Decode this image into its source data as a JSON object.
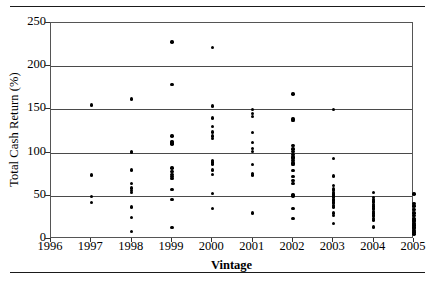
{
  "chart_data": {
    "type": "scatter",
    "title": "",
    "xlabel": "Vintage",
    "ylabel": "Total Cash Return (%)",
    "xlim": [
      1996,
      2005
    ],
    "ylim": [
      0,
      250
    ],
    "x_tick_labels": [
      "1996",
      "1997",
      "1998",
      "1999",
      "2000",
      "2001",
      "2002",
      "2003",
      "2004",
      "2005"
    ],
    "y_tick_labels": [
      "0",
      "50",
      "100",
      "150",
      "200",
      "250"
    ],
    "y_ticks": [
      0,
      50,
      100,
      150,
      200,
      250
    ],
    "grid": "horizontal",
    "legend": "none",
    "marker": "filled-circle",
    "marker_color": "#000000",
    "series": [
      {
        "name": "Total Cash Return by Vintage",
        "points": [
          {
            "x": 1997,
            "y": 155
          },
          {
            "x": 1997,
            "y": 74
          },
          {
            "x": 1997,
            "y": 49
          },
          {
            "x": 1997,
            "y": 42
          },
          {
            "x": 1998,
            "y": 162
          },
          {
            "x": 1998,
            "y": 101
          },
          {
            "x": 1998,
            "y": 100
          },
          {
            "x": 1998,
            "y": 80
          },
          {
            "x": 1998,
            "y": 64
          },
          {
            "x": 1998,
            "y": 59
          },
          {
            "x": 1998,
            "y": 56
          },
          {
            "x": 1998,
            "y": 54
          },
          {
            "x": 1998,
            "y": 37
          },
          {
            "x": 1998,
            "y": 25
          },
          {
            "x": 1998,
            "y": 9
          },
          {
            "x": 1999,
            "y": 228
          },
          {
            "x": 1999,
            "y": 179
          },
          {
            "x": 1999,
            "y": 119
          },
          {
            "x": 1999,
            "y": 113
          },
          {
            "x": 1999,
            "y": 111
          },
          {
            "x": 1999,
            "y": 110
          },
          {
            "x": 1999,
            "y": 82
          },
          {
            "x": 1999,
            "y": 78
          },
          {
            "x": 1999,
            "y": 75
          },
          {
            "x": 1999,
            "y": 72
          },
          {
            "x": 1999,
            "y": 70
          },
          {
            "x": 1999,
            "y": 57
          },
          {
            "x": 1999,
            "y": 46
          },
          {
            "x": 1999,
            "y": 13
          },
          {
            "x": 2000,
            "y": 222
          },
          {
            "x": 2000,
            "y": 154
          },
          {
            "x": 2000,
            "y": 140
          },
          {
            "x": 2000,
            "y": 130
          },
          {
            "x": 2000,
            "y": 124
          },
          {
            "x": 2000,
            "y": 119
          },
          {
            "x": 2000,
            "y": 116
          },
          {
            "x": 2000,
            "y": 91
          },
          {
            "x": 2000,
            "y": 89
          },
          {
            "x": 2000,
            "y": 87
          },
          {
            "x": 2000,
            "y": 80
          },
          {
            "x": 2000,
            "y": 75
          },
          {
            "x": 2000,
            "y": 53
          },
          {
            "x": 2000,
            "y": 35
          },
          {
            "x": 2001,
            "y": 150
          },
          {
            "x": 2001,
            "y": 145
          },
          {
            "x": 2001,
            "y": 142
          },
          {
            "x": 2001,
            "y": 123
          },
          {
            "x": 2001,
            "y": 112
          },
          {
            "x": 2001,
            "y": 105
          },
          {
            "x": 2001,
            "y": 101
          },
          {
            "x": 2001,
            "y": 86
          },
          {
            "x": 2001,
            "y": 76
          },
          {
            "x": 2001,
            "y": 74
          },
          {
            "x": 2001,
            "y": 30
          },
          {
            "x": 2002,
            "y": 168
          },
          {
            "x": 2002,
            "y": 139
          },
          {
            "x": 2002,
            "y": 137
          },
          {
            "x": 2002,
            "y": 108
          },
          {
            "x": 2002,
            "y": 104
          },
          {
            "x": 2002,
            "y": 101
          },
          {
            "x": 2002,
            "y": 98
          },
          {
            "x": 2002,
            "y": 95
          },
          {
            "x": 2002,
            "y": 93
          },
          {
            "x": 2002,
            "y": 91
          },
          {
            "x": 2002,
            "y": 88
          },
          {
            "x": 2002,
            "y": 86
          },
          {
            "x": 2002,
            "y": 79
          },
          {
            "x": 2002,
            "y": 72
          },
          {
            "x": 2002,
            "y": 68
          },
          {
            "x": 2002,
            "y": 64
          },
          {
            "x": 2002,
            "y": 51
          },
          {
            "x": 2002,
            "y": 50
          },
          {
            "x": 2002,
            "y": 35
          },
          {
            "x": 2002,
            "y": 24
          },
          {
            "x": 2003,
            "y": 150
          },
          {
            "x": 2003,
            "y": 93
          },
          {
            "x": 2003,
            "y": 73
          },
          {
            "x": 2003,
            "y": 62
          },
          {
            "x": 2003,
            "y": 58
          },
          {
            "x": 2003,
            "y": 56
          },
          {
            "x": 2003,
            "y": 54
          },
          {
            "x": 2003,
            "y": 52
          },
          {
            "x": 2003,
            "y": 51
          },
          {
            "x": 2003,
            "y": 50
          },
          {
            "x": 2003,
            "y": 49
          },
          {
            "x": 2003,
            "y": 48
          },
          {
            "x": 2003,
            "y": 46
          },
          {
            "x": 2003,
            "y": 45
          },
          {
            "x": 2003,
            "y": 43
          },
          {
            "x": 2003,
            "y": 41
          },
          {
            "x": 2003,
            "y": 39
          },
          {
            "x": 2003,
            "y": 37
          },
          {
            "x": 2003,
            "y": 30
          },
          {
            "x": 2003,
            "y": 27
          },
          {
            "x": 2003,
            "y": 18
          },
          {
            "x": 2004,
            "y": 54
          },
          {
            "x": 2004,
            "y": 48
          },
          {
            "x": 2004,
            "y": 46
          },
          {
            "x": 2004,
            "y": 44
          },
          {
            "x": 2004,
            "y": 42
          },
          {
            "x": 2004,
            "y": 40
          },
          {
            "x": 2004,
            "y": 38
          },
          {
            "x": 2004,
            "y": 36
          },
          {
            "x": 2004,
            "y": 34
          },
          {
            "x": 2004,
            "y": 32
          },
          {
            "x": 2004,
            "y": 30
          },
          {
            "x": 2004,
            "y": 28
          },
          {
            "x": 2004,
            "y": 26
          },
          {
            "x": 2004,
            "y": 24
          },
          {
            "x": 2004,
            "y": 22
          },
          {
            "x": 2004,
            "y": 14
          },
          {
            "x": 2005,
            "y": 52
          },
          {
            "x": 2005,
            "y": 41
          },
          {
            "x": 2005,
            "y": 38
          },
          {
            "x": 2005,
            "y": 34
          },
          {
            "x": 2005,
            "y": 30
          },
          {
            "x": 2005,
            "y": 27
          },
          {
            "x": 2005,
            "y": 24
          },
          {
            "x": 2005,
            "y": 22
          },
          {
            "x": 2005,
            "y": 20
          },
          {
            "x": 2005,
            "y": 18
          },
          {
            "x": 2005,
            "y": 16
          },
          {
            "x": 2005,
            "y": 14
          },
          {
            "x": 2005,
            "y": 12
          },
          {
            "x": 2005,
            "y": 10
          },
          {
            "x": 2005,
            "y": 8
          },
          {
            "x": 2005,
            "y": 6
          }
        ]
      }
    ]
  }
}
